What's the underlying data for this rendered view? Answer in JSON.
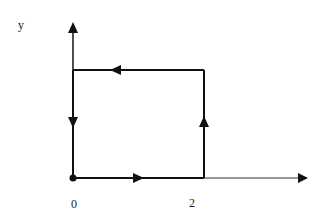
{
  "diagram": {
    "type": "path-on-axes",
    "axes": {
      "x_label": "",
      "y_label": "y",
      "origin_label": "0",
      "x_tick_label": "2"
    },
    "path": {
      "start_point": "origin",
      "direction": "counter-clockwise",
      "segments": [
        {
          "from": "(0,0)",
          "to": "(2,0)",
          "arrow": "right"
        },
        {
          "from": "(2,0)",
          "to": "(2,1)",
          "arrow": "up"
        },
        {
          "from": "(2,1)",
          "to": "(0,1)",
          "arrow": "left"
        },
        {
          "from": "(0,1)",
          "to": "(0,0)",
          "arrow": "down"
        }
      ]
    },
    "colors": {
      "line": "#111111",
      "background": "#ffffff",
      "text": "#222222"
    }
  }
}
